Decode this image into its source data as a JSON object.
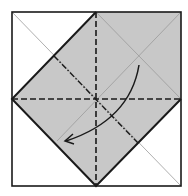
{
  "diagram": {
    "type": "origami-fold-diagram",
    "colors": {
      "background": "#ffffff",
      "paper_fill": "#c8c8c8",
      "line": "#1a1a1a",
      "thin_line": "#9a9a9a"
    },
    "elements": {
      "outer_square": "square paper outline",
      "shaded_diamond": "folded gray region",
      "valley_fold_vertical": "dashed vertical crease",
      "valley_fold_horizontal": "dashed horizontal crease",
      "mountain_fold_diagonal": "dash-dot diagonal crease",
      "fold_arrow": "curved arrow indicating fold direction"
    }
  }
}
